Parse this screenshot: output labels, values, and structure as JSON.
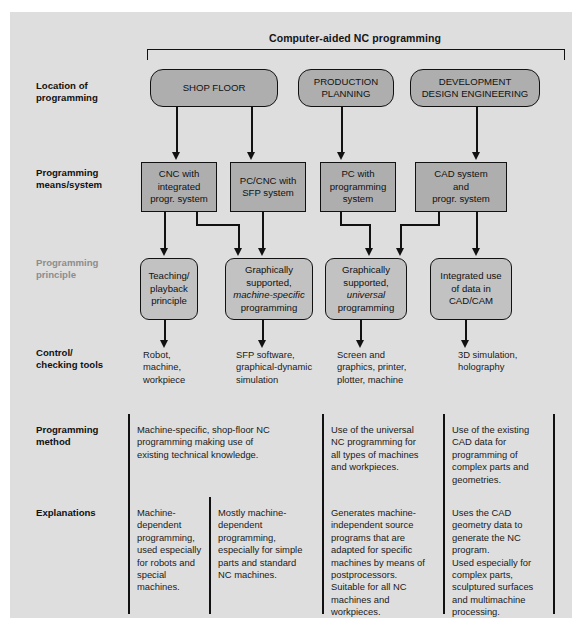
{
  "diagram": {
    "title": "Computer-aided NC programming",
    "row_labels": {
      "location": "Location of\nprogramming",
      "means": "Programming\nmeans/system",
      "principle": "Programming\nprinciple",
      "control": "Control/\nchecking tools",
      "method": "Programming\nmethod",
      "explanations": "Explanations"
    },
    "location_boxes": [
      {
        "label": "SHOP FLOOR"
      },
      {
        "label": "PRODUCTION\nPLANNING"
      },
      {
        "label": "DEVELOPMENT\nDESIGN ENGINEERING"
      }
    ],
    "means_boxes": [
      {
        "label": "CNC with\nintegrated\nprogr. system"
      },
      {
        "label": "PC/CNC with\nSFP system"
      },
      {
        "label": "PC with\nprogramming\nsystem"
      },
      {
        "label": "CAD system\nand\nprogr. system"
      }
    ],
    "principle_boxes": [
      {
        "line1": "Teaching/",
        "line2": "playback",
        "line3": "principle",
        "italic": ""
      },
      {
        "line1": "Graphically",
        "line2": "supported,",
        "italic": "machine-specific",
        "line3": "programming"
      },
      {
        "line1": "Graphically",
        "line2": "supported,",
        "italic": "universal",
        "line3": "programming"
      },
      {
        "line1": "Integrated use",
        "line2": "of data in",
        "line3": "CAD/CAM",
        "italic": ""
      }
    ],
    "control_tools": [
      "Robot,\nmachine,\nworkpiece",
      "SFP software,\ngraphical-dynamic\nsimulation",
      "Screen and\ngraphics, printer,\nplotter, machine",
      "3D simulation,\nholography"
    ],
    "programming_method": [
      "Machine-specific, shop-floor NC\nprogramming making use of\nexisting technical knowledge.",
      "Use of the universal\nNC programming for\nall types of machines\nand workpieces.",
      "Use of the existing\nCAD data for\nprogramming of\ncomplex parts and\ngeometries."
    ],
    "explanations": [
      "Machine-\ndependent\nprogramming,\nused especially\nfor robots and\nspecial\nmachines.",
      "Mostly machine-\ndependent\nprogramming,\nespecially for simple\nparts and standard\nNC machines.",
      "Generates machine-\nindependent source\nprograms that are\nadapted for specific\nmachines by means of\npostprocessors.\nSuitable for all NC\nmachines and\nworkpieces.",
      "Uses the CAD\ngeometry data to\ngenerate the NC\nprogram.\nUsed especially for\ncomplex parts,\nsculptured surfaces\nand multimachine\nprocessing."
    ],
    "colors": {
      "panel_background": "#dedede",
      "box_fill_dark": "#aeaeae",
      "box_fill_light": "#c2c2c2",
      "line": "#111111",
      "text": "#1a1a1a",
      "dim_label": "#8d8d8d"
    }
  }
}
